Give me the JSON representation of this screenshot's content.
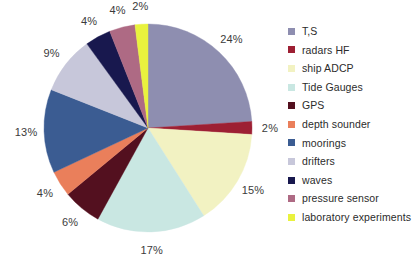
{
  "chart_data": {
    "type": "pie",
    "title": "",
    "subtitle": "",
    "xlabel": "",
    "ylabel": "",
    "legend_position": "right",
    "grid": false,
    "start_angle_deg": 0,
    "direction": "clockwise",
    "categories": [
      "T,S",
      "radars HF",
      "ship ADCP",
      "Tide Gauges",
      "GPS",
      "depth sounder",
      "moorings",
      "drifters",
      "waves",
      "pressure sensor",
      "laboratory experiments"
    ],
    "values": [
      24,
      2,
      15,
      17,
      6,
      4,
      13,
      9,
      4,
      4,
      2
    ],
    "value_labels": [
      "24%",
      "2%",
      "15%",
      "17%",
      "6%",
      "4%",
      "13%",
      "9%",
      "4%",
      "4%",
      "2%"
    ],
    "unit": "%",
    "total": 100,
    "colors": [
      "#8e8eb0",
      "#9d1f33",
      "#f2f2c2",
      "#c9e7e2",
      "#53101f",
      "#ea7f5b",
      "#3b5c92",
      "#c7c7da",
      "#18184e",
      "#ae6a84",
      "#e9f23e"
    ],
    "slices": [
      {
        "label": "T,S",
        "value": 24,
        "value_label": "24%",
        "color": "#8e8eb0"
      },
      {
        "label": "radars HF",
        "value": 2,
        "value_label": "2%",
        "color": "#9d1f33"
      },
      {
        "label": "ship ADCP",
        "value": 15,
        "value_label": "15%",
        "color": "#f2f2c2"
      },
      {
        "label": "Tide Gauges",
        "value": 17,
        "value_label": "17%",
        "color": "#c9e7e2"
      },
      {
        "label": "GPS",
        "value": 6,
        "value_label": "6%",
        "color": "#53101f"
      },
      {
        "label": "depth sounder",
        "value": 4,
        "value_label": "4%",
        "color": "#ea7f5b"
      },
      {
        "label": "moorings",
        "value": 13,
        "value_label": "13%",
        "color": "#3b5c92"
      },
      {
        "label": "drifters",
        "value": 9,
        "value_label": "9%",
        "color": "#c7c7da"
      },
      {
        "label": "waves",
        "value": 4,
        "value_label": "4%",
        "color": "#18184e"
      },
      {
        "label": "pressure sensor",
        "value": 4,
        "value_label": "4%",
        "color": "#ae6a84"
      },
      {
        "label": "laboratory experiments",
        "value": 2,
        "value_label": "2%",
        "color": "#e9f23e"
      }
    ]
  },
  "geometry": {
    "center_x": 148,
    "center_y": 128,
    "radius": 104,
    "label_radius": 122
  },
  "legend": {
    "items": [
      {
        "label": "T,S",
        "color": "#8e8eb0"
      },
      {
        "label": "radars HF",
        "color": "#9d1f33"
      },
      {
        "label": "ship ADCP",
        "color": "#f2f2c2"
      },
      {
        "label": "Tide Gauges",
        "color": "#c9e7e2"
      },
      {
        "label": "GPS",
        "color": "#53101f"
      },
      {
        "label": "depth sounder",
        "color": "#ea7f5b"
      },
      {
        "label": "moorings",
        "color": "#3b5c92"
      },
      {
        "label": "drifters",
        "color": "#c7c7da"
      },
      {
        "label": "waves",
        "color": "#18184e"
      },
      {
        "label": "pressure sensor",
        "color": "#ae6a84"
      },
      {
        "label": "laboratory experiments",
        "color": "#e9f23e"
      }
    ]
  }
}
